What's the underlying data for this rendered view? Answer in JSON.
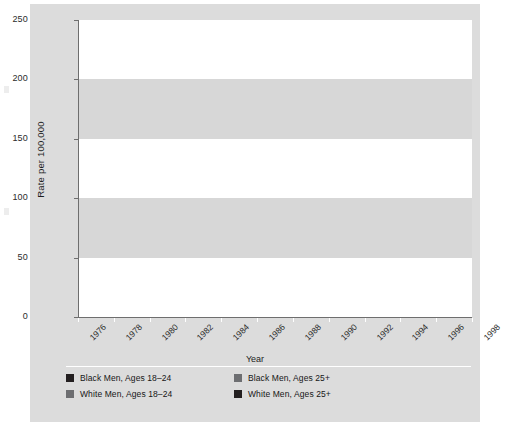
{
  "chart_data": {
    "type": "line",
    "title": "",
    "xlabel": "Year",
    "ylabel": "Rate per 100,000",
    "xlim": [
      1976,
      1998
    ],
    "ylim": [
      0,
      250
    ],
    "ytick_labels": [
      "0",
      "50",
      "100",
      "150",
      "200",
      "250"
    ],
    "yticks": [
      0,
      50,
      100,
      150,
      200,
      250
    ],
    "xtick_labels": [
      "1976",
      "1978",
      "1980",
      "1982",
      "1984",
      "1986",
      "1988",
      "1990",
      "1992",
      "1994",
      "1996",
      "1998"
    ],
    "xticks": [
      1976,
      1978,
      1980,
      1982,
      1984,
      1986,
      1988,
      1990,
      1992,
      1994,
      1996,
      1998
    ],
    "grid": false,
    "banded_background": true,
    "legend_position": "below",
    "x": [
      1976,
      1977,
      1978,
      1979,
      1980,
      1981,
      1982,
      1983,
      1984,
      1985,
      1986,
      1987,
      1988,
      1989,
      1990,
      1991,
      1992,
      1993,
      1994,
      1995,
      1996,
      1997,
      1998
    ],
    "series": [
      {
        "name": "Black Men, Ages 18–24",
        "color": "#231f20",
        "values": [
          88,
          85,
          85,
          91,
          96,
          89,
          82,
          74,
          68,
          64,
          70,
          85,
          101,
          123,
          144,
          170,
          168,
          175,
          184,
          177,
          151,
          140,
          119
        ]
      },
      {
        "name": "Black Men, Ages 25+",
        "color": "#6d6e71",
        "values": [
          97,
          93,
          88,
          93,
          97,
          91,
          85,
          77,
          70,
          64,
          66,
          71,
          66,
          69,
          71,
          73,
          75,
          72,
          71,
          69,
          62,
          52,
          42
        ]
      },
      {
        "name": "White Men, Ages 18–24",
        "color": "#6d6e71",
        "values": [
          12,
          13,
          15,
          17,
          18,
          18,
          17,
          15,
          14,
          13,
          13,
          13,
          14,
          16,
          19,
          20,
          19,
          19,
          20,
          19,
          17,
          16,
          16
        ]
      },
      {
        "name": "White Men, Ages 25+",
        "color": "#231f20",
        "values": [
          12,
          12,
          12,
          13,
          13,
          13,
          12,
          11,
          11,
          11,
          11,
          11,
          11,
          11,
          11,
          11,
          11,
          10,
          10,
          9,
          8,
          8,
          7
        ]
      }
    ]
  },
  "axes": {
    "ylabel": "Rate per 100,000",
    "xlabel": "Year"
  },
  "legend": {
    "items": [
      {
        "label": "Black Men, Ages 18–24",
        "color": "#231f20"
      },
      {
        "label": "Black Men, Ages 25+",
        "color": "#6d6e71"
      },
      {
        "label": "White Men, Ages 18–24",
        "color": "#6d6e71"
      },
      {
        "label": "White Men, Ages 25+",
        "color": "#231f20"
      }
    ]
  },
  "colors": {
    "figure_background": "#dcdcdc",
    "band_white": "#ffffff",
    "band_gray": "#d7d7d7",
    "axis": "#6e6e6e",
    "dark_series": "#231f20",
    "gray_series": "#6d6e71"
  }
}
